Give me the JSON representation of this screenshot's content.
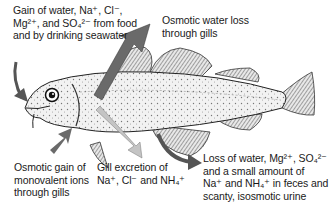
{
  "diagram": {
    "labels": [
      {
        "id": "gain_food_seawater",
        "lines": [
          "Gain of water, Na⁺, Cl⁻,",
          "Mg²⁺, and SO₄²⁻ from food",
          "and by drinking seawater"
        ]
      },
      {
        "id": "osmotic_water_loss",
        "lines": [
          "Osmotic water loss",
          "through gills"
        ]
      },
      {
        "id": "osmotic_gain_ions",
        "lines": [
          "Osmotic gain of",
          "monovalent ions",
          "through gills"
        ]
      },
      {
        "id": "gill_excretion",
        "lines": [
          "Gill excretion of",
          "Na⁺, Cl⁻ and NH₄⁺"
        ]
      },
      {
        "id": "loss_feces_urine",
        "lines": [
          "Loss of water, Mg²⁺, SO₄²⁻",
          "and a small amount of",
          "Na⁺ and NH₄⁺ in feces and",
          "scanty, isosmotic urine"
        ]
      }
    ],
    "arrows": [
      {
        "name": "inflow-mouth-arrow",
        "direction": "into fish at mouth",
        "color": "#555555"
      },
      {
        "name": "water-loss-arrow",
        "direction": "out of fish upward from gills",
        "color": "#666666"
      },
      {
        "name": "ion-gain-arrow",
        "direction": "into fish at gills from below",
        "color": "#666666"
      },
      {
        "name": "gill-excretion-arrow",
        "direction": "out of fish downward from gills",
        "color": "#bbbbbb"
      },
      {
        "name": "feces-urine-arrow",
        "direction": "out of fish from vent",
        "color": "#555555"
      }
    ]
  }
}
